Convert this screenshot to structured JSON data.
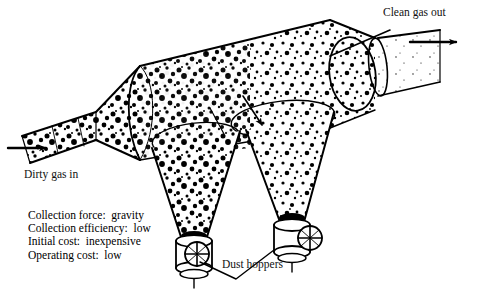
{
  "diagram": {
    "type": "technical-line-drawing",
    "background_color": "#ffffff",
    "line_color": "#000000"
  },
  "labels": {
    "inlet": "Dirty gas in",
    "outlet": "Clean gas out",
    "hoppers": "Dust hoppers"
  },
  "specs": {
    "lines": [
      "Collection force:  gravity",
      "Collection efficiency:  low",
      "Initial cost:  inexpensive",
      "Operating cost:  low"
    ]
  },
  "icons": {
    "inlet_arrow": "arrow-right-icon",
    "outlet_arrow": "arrow-right-icon",
    "settling_arrow": "arrow-down-right-icon",
    "rotary_valve": "rotary-valve-icon"
  },
  "components": {
    "inlet_duct": "dirty gas inlet duct",
    "expansion_cone": "expansion transition",
    "settling_chamber": "horizontal cylindrical settling chamber",
    "outlet_duct": "clean gas outlet duct",
    "hopper_left": "left dust hopper cone",
    "hopper_right": "right dust hopper cone",
    "valve_left": "left rotary discharge valve",
    "valve_right": "right rotary discharge valve"
  }
}
